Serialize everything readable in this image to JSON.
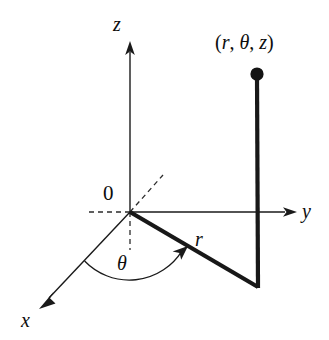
{
  "figure": {
    "background_color": "#ffffff",
    "ink_color": "#1a1a1a",
    "width": 329,
    "height": 340
  },
  "labels": {
    "z_axis": "z",
    "y_axis": "y",
    "x_axis": "x",
    "origin": "0",
    "radius": "r",
    "angle": "θ",
    "point_open": "(",
    "point_r": "r",
    "point_comma1": ", ",
    "point_theta": "θ",
    "point_comma2": ", ",
    "point_z": "z",
    "point_close": ")",
    "point_full": "(r, θ, z)"
  },
  "geometry": {
    "origin": {
      "x": 130,
      "y": 212
    },
    "z_axis_tip": {
      "x": 130,
      "y": 43
    },
    "y_axis_tip": {
      "x": 296,
      "y": 212
    },
    "x_axis_tip": {
      "x": 40,
      "y": 308
    },
    "radius_end": {
      "x": 258,
      "y": 287
    },
    "point": {
      "x": 257,
      "y": 74
    },
    "dashed_negative_x_tip": {
      "x": 163,
      "y": 175
    },
    "dashed_negative_y_tip": {
      "x": 88,
      "y": 212
    },
    "dashed_negative_z_tip": {
      "x": 130,
      "y": 250
    },
    "theta_arc_radius": 62
  }
}
